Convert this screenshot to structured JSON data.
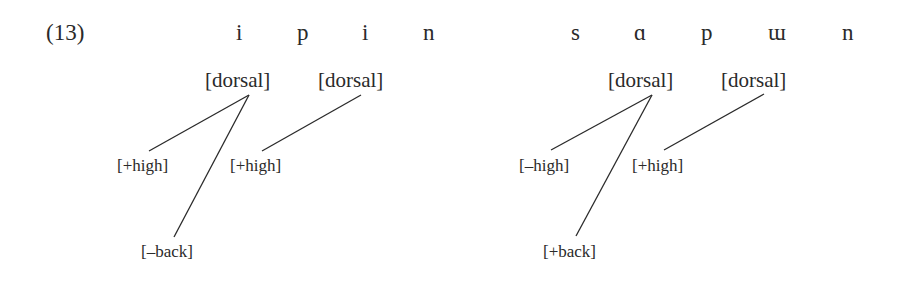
{
  "example_number": "(13)",
  "examples": [
    {
      "segments": [
        "i",
        "p",
        "i",
        "n"
      ],
      "dorsal_nodes": [
        "[dorsal]",
        "[dorsal]"
      ],
      "dependents": {
        "high_1": "[+high]",
        "back_1": "[–back]",
        "high_2": "[+high]"
      }
    },
    {
      "segments": [
        "s",
        "ɑ",
        "p",
        "ɯ",
        "n"
      ],
      "dorsal_nodes": [
        "[dorsal]",
        "[dorsal]"
      ],
      "dependents": {
        "high_1": "[–high]",
        "back_1": "[+back]",
        "high_2": "[+high]"
      }
    }
  ],
  "colors": {
    "ink": "#2a2a2a",
    "background": "#ffffff"
  }
}
